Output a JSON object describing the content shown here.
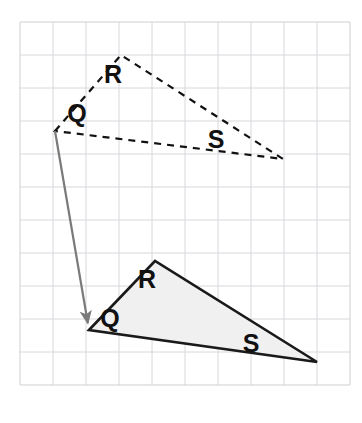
{
  "figure": {
    "type": "geometry-translation-diagram",
    "canvas": {
      "width": 362,
      "height": 423,
      "background": "#ffffff"
    },
    "grid": {
      "name": "graph-paper-grid",
      "origin_x": 20,
      "origin_y": 22,
      "cell_size": 33,
      "columns": 10,
      "rows": 11,
      "line_color": "#d8d8dc",
      "border_color": "#cfcfd4",
      "visible": true
    },
    "shapes": [
      {
        "id": "preimage-triangle",
        "name": "Triangle QRS (pre-image)",
        "style": "dashed",
        "stroke": "#111111",
        "stroke_width": 2.2,
        "dash_pattern": "7 6",
        "fill": "none",
        "points": "55,131 121,55 283,159",
        "vertices": [
          {
            "name": "Q",
            "x": 55,
            "y": 131
          },
          {
            "name": "R",
            "x": 121,
            "y": 55
          },
          {
            "name": "S",
            "x": 283,
            "y": 159
          }
        ],
        "labels": [
          {
            "text": "Q",
            "x": 77,
            "y": 122,
            "font_size": 25
          },
          {
            "text": "R",
            "x": 113,
            "y": 83,
            "font_size": 25
          },
          {
            "text": "S",
            "x": 216,
            "y": 148,
            "font_size": 25
          }
        ]
      },
      {
        "id": "image-triangle",
        "name": "Triangle Q'R'S' (image)",
        "style": "solid",
        "stroke": "#1a1a1a",
        "stroke_width": 2.6,
        "fill": "#f0f0f0",
        "points": "89,330 155,261 317,362",
        "vertices": [
          {
            "name": "Q",
            "x": 89,
            "y": 330
          },
          {
            "name": "R",
            "x": 155,
            "y": 261
          },
          {
            "name": "S",
            "x": 317,
            "y": 362
          }
        ],
        "labels": [
          {
            "text": "Q",
            "x": 110,
            "y": 327,
            "font_size": 25
          },
          {
            "text": "R",
            "x": 147,
            "y": 288,
            "font_size": 25
          },
          {
            "text": "S",
            "x": 251,
            "y": 352,
            "font_size": 25
          }
        ]
      }
    ],
    "translation_arrow": {
      "name": "translation-vector-arrow",
      "from_x": 55,
      "from_y": 131,
      "to_x": 89,
      "to_y": 330,
      "stroke": "#7a7a7a",
      "stroke_width": 2.2,
      "head_length": 13,
      "head_width": 10
    }
  }
}
